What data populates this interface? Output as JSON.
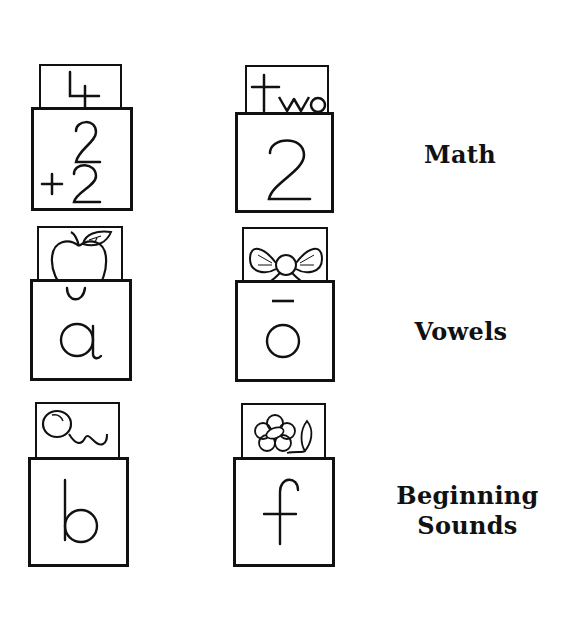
{
  "rows": [
    {
      "category": "Math",
      "left": {
        "card_text": "4",
        "front_top": "2",
        "front_bottom": "+2",
        "icon": "number-four"
      },
      "right": {
        "card_text": "two",
        "front_text": "2",
        "icon": "word-two"
      }
    },
    {
      "category": "Vowels",
      "left": {
        "card_picture": "apple-icon",
        "front_mark": "˘",
        "front_text": "a"
      },
      "right": {
        "card_picture": "bow-icon",
        "front_mark": "¯",
        "front_text": "o"
      }
    },
    {
      "category": "Beginning Sounds",
      "category_lines": [
        "Beginning",
        "Sounds"
      ],
      "left": {
        "card_picture": "balloon-icon",
        "front_text": "b"
      },
      "right": {
        "card_picture": "flower-icon",
        "front_text": "f"
      }
    }
  ],
  "colors": {
    "ink": "#111111",
    "paper": "#ffffff"
  }
}
